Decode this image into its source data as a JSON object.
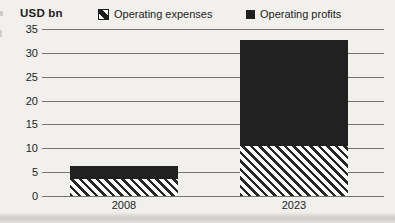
{
  "header": {
    "unit_label": "USD bn"
  },
  "legend": [
    {
      "name": "Operating expenses",
      "style": "hatched"
    },
    {
      "name": "Operating profits",
      "style": "solid"
    }
  ],
  "chart_data": {
    "type": "bar",
    "stacked": true,
    "title": "",
    "unit_label": "USD bn",
    "categories": [
      "2008",
      "2023"
    ],
    "series": [
      {
        "name": "Operating expenses",
        "style": "hatched",
        "values": [
          3.6,
          10.4
        ]
      },
      {
        "name": "Operating profits",
        "style": "solid",
        "values": [
          2.6,
          22.4
        ]
      }
    ],
    "totals": [
      6.2,
      32.8
    ],
    "ylim": [
      0,
      35
    ],
    "yticks": [
      0,
      5,
      10,
      15,
      20,
      25,
      30,
      35
    ],
    "grid": "horizontal",
    "legend_position": "top"
  },
  "colors": {
    "ink": "#1d1d1d",
    "bar_solid": "#212121",
    "background": "#f1f0ed",
    "gridline": "#737373"
  }
}
